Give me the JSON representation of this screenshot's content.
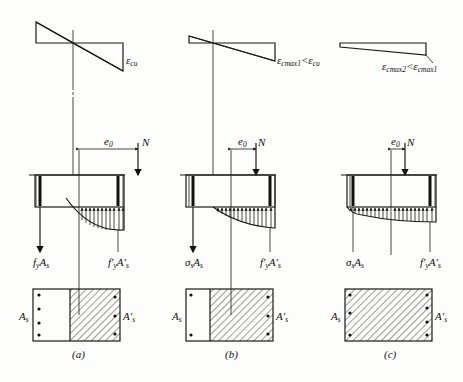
{
  "figure": {
    "panels": [
      {
        "id": "a",
        "caption": "(a)",
        "strain_label": "ε",
        "strain_sub": "cu",
        "strain_condition": "",
        "eccentricity_label": "e",
        "eccentricity_sub": "0",
        "load_label": "N",
        "tension_force": {
          "main": "f",
          "sub1": "y",
          "mid": "A",
          "sub2": "s"
        },
        "compression_force": {
          "main": "f′",
          "sub1": "y",
          "mid": "A′",
          "sub2": "s"
        },
        "steel_left_label": {
          "main": "A",
          "sub": "s"
        },
        "steel_right_label": {
          "main": "A′",
          "sub": "s"
        }
      },
      {
        "id": "b",
        "caption": "(b)",
        "strain_label": "ε",
        "strain_sub": "cmax1",
        "strain_condition": "<ε",
        "strain_condition_sub": "cu",
        "eccentricity_label": "e",
        "eccentricity_sub": "0",
        "load_label": "N",
        "tension_force": {
          "main": "σ",
          "sub1": "s",
          "mid": "A",
          "sub2": "s"
        },
        "compression_force": {
          "main": "f′",
          "sub1": "y",
          "mid": "A′",
          "sub2": "s"
        },
        "steel_left_label": {
          "main": "A",
          "sub": "s"
        },
        "steel_right_label": {
          "main": "A′",
          "sub": "s"
        }
      },
      {
        "id": "c",
        "caption": "(c)",
        "strain_label": "ε",
        "strain_sub": "cmax2",
        "strain_condition": "<ε",
        "strain_condition_sub": "cmax1",
        "eccentricity_label": "e",
        "eccentricity_sub": "0",
        "load_label": "N",
        "tension_force": {
          "main": "σ",
          "sub1": "s",
          "mid": "A",
          "sub2": "s"
        },
        "compression_force": {
          "main": "f′",
          "sub1": "y",
          "mid": "A′",
          "sub2": "s"
        },
        "steel_left_label": {
          "main": "A",
          "sub": "s"
        },
        "steel_right_label": {
          "main": "A′",
          "sub": "s"
        }
      }
    ]
  }
}
